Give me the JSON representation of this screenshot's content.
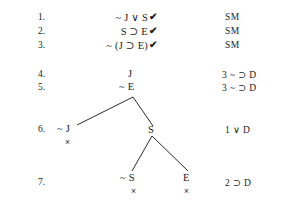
{
  "document": {
    "type": "truth-tree-proof",
    "background_color": "#ffffff",
    "text_color": "#1b1b1b"
  },
  "proof": {
    "lines": [
      {
        "number": "1.",
        "formula": "~ J ∨ S",
        "checked": true,
        "check_glyph": "✔",
        "justification": "SM"
      },
      {
        "number": "2.",
        "formula": "S ⊃ E",
        "checked": true,
        "check_glyph": "✔",
        "justification": "SM"
      },
      {
        "number": "3.",
        "formula": "~ (J ⊃ E)",
        "checked": true,
        "check_glyph": "✔",
        "justification": "SM"
      },
      {
        "number": "4.",
        "formula": "J",
        "checked": false,
        "check_glyph": "",
        "justification": "3  ~ ⊃ D"
      },
      {
        "number": "5.",
        "formula": "~ E",
        "checked": false,
        "check_glyph": "",
        "justification": "3  ~ ⊃ D"
      },
      {
        "number": "6.",
        "formula": "",
        "checked": false,
        "check_glyph": "",
        "justification": "1 ∨ D"
      },
      {
        "number": "7.",
        "formula": "",
        "checked": false,
        "check_glyph": "",
        "justification": "2 ⊃ D"
      }
    ]
  },
  "tree": {
    "nodes": [
      {
        "id": "node-j",
        "label": "J",
        "closed": false,
        "close_glyph": ""
      },
      {
        "id": "node-not-e",
        "label": "~ E",
        "closed": false,
        "close_glyph": ""
      },
      {
        "id": "node-not-j",
        "label": "~ J",
        "closed": true,
        "close_glyph": "×"
      },
      {
        "id": "node-s",
        "label": "S",
        "closed": false,
        "close_glyph": ""
      },
      {
        "id": "node-not-s",
        "label": "~ S",
        "closed": true,
        "close_glyph": "×"
      },
      {
        "id": "node-e",
        "label": "E",
        "closed": true,
        "close_glyph": "×"
      }
    ]
  }
}
